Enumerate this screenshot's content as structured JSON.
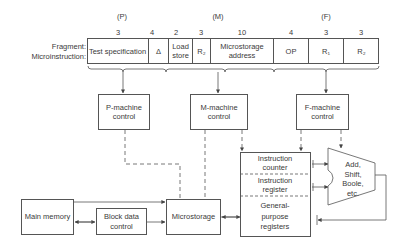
{
  "fragment_label": "Fragment:",
  "microinstruction_label": "Microinstruction:",
  "groups": [
    {
      "label": "(P)"
    },
    {
      "label": "(M)"
    },
    {
      "label": "(F)"
    }
  ],
  "fields": [
    {
      "bits": "3",
      "label": "Test specification"
    },
    {
      "bits": "4",
      "label": "Δ"
    },
    {
      "bits": "2",
      "label": "Load store"
    },
    {
      "bits": "3",
      "label": "R₂"
    },
    {
      "bits": "10",
      "label": "Microstorage address"
    },
    {
      "bits": "4",
      "label": "OP"
    },
    {
      "bits": "3",
      "label": "R₁"
    },
    {
      "bits": "3",
      "label": "R₂"
    }
  ],
  "blocks": {
    "p_machine": "P-machine control",
    "m_machine": "M-machine control",
    "f_machine": "F-machine control",
    "main_memory": "Main memory",
    "block_data": "Block data control",
    "microstorage": "Microstorage",
    "alu": "Add, Shift, Boole, etc."
  },
  "registers": {
    "instruction_counter": "Instruction counter",
    "instruction_register": "Instruction register",
    "general_purpose": "General-purpose registers"
  },
  "colors": {
    "line": "#555555",
    "text": "#3a3a3a",
    "background": "#ffffff"
  }
}
